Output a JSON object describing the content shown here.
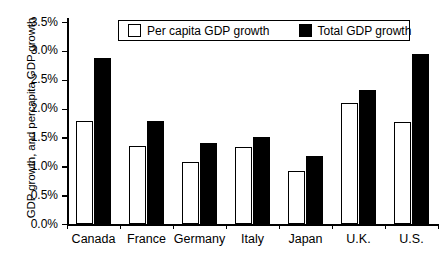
{
  "chart_data": {
    "type": "bar",
    "title": "",
    "xlabel": "",
    "ylabel": "GDP growth, and percapita GDP growth",
    "ylim": [
      0,
      3.5
    ],
    "ytick_labels": [
      "0.0%",
      "0.5%",
      "1.0%",
      "1.5%",
      "2.0%",
      "2.5%",
      "3.0%",
      "3.5%"
    ],
    "ytick_values": [
      0,
      0.5,
      1.0,
      1.5,
      2.0,
      2.5,
      3.0,
      3.5
    ],
    "grid": false,
    "legend_position": "top-center",
    "categories": [
      "Canada",
      "France",
      "Germany",
      "Italy",
      "Japan",
      "U.K.",
      "U.S."
    ],
    "series": [
      {
        "name": "Per capita GDP growth",
        "color": "#ffffff",
        "edge_color": "#000000",
        "values": [
          1.78,
          1.36,
          1.08,
          1.33,
          0.91,
          2.09,
          1.76
        ]
      },
      {
        "name": "Total GDP growth",
        "color": "#000000",
        "edge_color": "#000000",
        "values": [
          2.88,
          1.79,
          1.4,
          1.5,
          1.18,
          2.33,
          2.94
        ]
      }
    ]
  }
}
